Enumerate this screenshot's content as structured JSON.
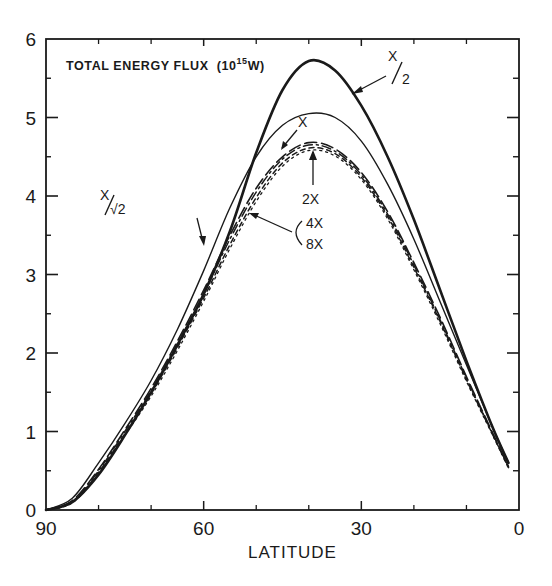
{
  "chart_data": {
    "type": "line",
    "title_parts": {
      "main": "TOTAL ENERGY FLUX",
      "unit_open": "(10",
      "unit_exp": "15",
      "unit_close": "W)"
    },
    "xlabel": "LATITUDE",
    "ylabel": "",
    "xlim": [
      90,
      0
    ],
    "ylim": [
      0,
      6
    ],
    "x_ticks": [
      90,
      60,
      30,
      0
    ],
    "x_tick_labels": [
      "90",
      "60",
      "30",
      "0"
    ],
    "x_minor_ticks": [
      80,
      70,
      50,
      40,
      20,
      10
    ],
    "y_ticks": [
      0,
      1,
      2,
      3,
      4,
      5,
      6
    ],
    "y_tick_labels": [
      "0",
      "1",
      "2",
      "3",
      "4",
      "5",
      "6"
    ],
    "y_minor_ticks": [
      0.5,
      1.5,
      2.5,
      3.5,
      4.5,
      5.5
    ],
    "grid": false,
    "legend": "inline annotations with arrows",
    "x": [
      90,
      85,
      80,
      75,
      70,
      65,
      60,
      55,
      50,
      45,
      40,
      35,
      30,
      25,
      20,
      15,
      10,
      5,
      2
    ],
    "series": [
      {
        "name": "X/2",
        "style": "thick-solid",
        "values": [
          0,
          0.1,
          0.45,
          0.95,
          1.5,
          2.1,
          2.75,
          3.55,
          4.55,
          5.35,
          5.72,
          5.6,
          5.15,
          4.5,
          3.7,
          2.8,
          1.9,
          1.05,
          0.6
        ]
      },
      {
        "name": "X/√2",
        "style": "thin-solid",
        "values": [
          0,
          0.15,
          0.6,
          1.1,
          1.65,
          2.3,
          3.05,
          3.85,
          4.5,
          4.9,
          5.05,
          5.0,
          4.7,
          4.15,
          3.45,
          2.65,
          1.85,
          1.05,
          0.6
        ]
      },
      {
        "name": "X",
        "style": "long-dash",
        "values": [
          0,
          0.12,
          0.52,
          1.02,
          1.55,
          2.15,
          2.8,
          3.5,
          4.1,
          4.5,
          4.68,
          4.6,
          4.3,
          3.8,
          3.15,
          2.45,
          1.7,
          0.98,
          0.55
        ]
      },
      {
        "name": "2X",
        "style": "dash-dot",
        "values": [
          0,
          0.11,
          0.5,
          1.0,
          1.52,
          2.12,
          2.75,
          3.45,
          4.05,
          4.47,
          4.65,
          4.57,
          4.27,
          3.77,
          3.12,
          2.42,
          1.68,
          0.97,
          0.55
        ]
      },
      {
        "name": "4X",
        "style": "short-dash",
        "values": [
          0,
          0.1,
          0.48,
          0.97,
          1.48,
          2.07,
          2.7,
          3.38,
          3.98,
          4.42,
          4.61,
          4.54,
          4.24,
          3.74,
          3.09,
          2.4,
          1.66,
          0.96,
          0.54
        ]
      },
      {
        "name": "8X",
        "style": "dotted",
        "values": [
          0,
          0.09,
          0.46,
          0.95,
          1.45,
          2.03,
          2.66,
          3.33,
          3.93,
          4.38,
          4.58,
          4.51,
          4.21,
          3.71,
          3.06,
          2.37,
          1.64,
          0.95,
          0.53
        ]
      }
    ],
    "annotations": [
      {
        "text": "X/2",
        "points_to": "X/2"
      },
      {
        "text": "X",
        "points_to": "X"
      },
      {
        "text": "2X",
        "points_to": "2X"
      },
      {
        "text": "4X",
        "points_to": "4X"
      },
      {
        "text": "8X",
        "points_to": "8X"
      },
      {
        "text": "X/√2",
        "points_to": "X/√2"
      }
    ]
  },
  "labels": {
    "title_main": "TOTAL ENERGY FLUX",
    "title_unit_open": "(10",
    "title_unit_exp": "15",
    "title_unit_close": "W)",
    "xlabel": "LATITUDE",
    "ann_x2_num": "X",
    "ann_x2_den": "2",
    "ann_x": "X",
    "ann_2x": "2X",
    "ann_4x": "4X",
    "ann_8x": "8X",
    "ann_xr2_num": "X",
    "ann_xr2_den": "√2"
  },
  "colors": {
    "ink": "#1a1a1a",
    "background": "#ffffff"
  }
}
